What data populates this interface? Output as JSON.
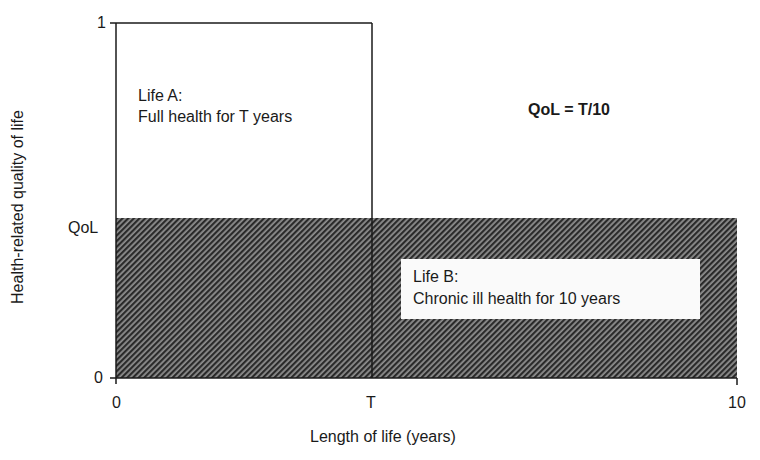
{
  "diagram": {
    "y_axis": {
      "title": "Health-related quality of life",
      "ticks": [
        {
          "label": "1",
          "value": 1
        },
        {
          "label": "QoL",
          "value": "QoL"
        },
        {
          "label": "0",
          "value": 0
        }
      ]
    },
    "x_axis": {
      "title": "Length of life (years)",
      "ticks": [
        {
          "label": "0",
          "value": 0
        },
        {
          "label": "T",
          "value": "T"
        },
        {
          "label": "10",
          "value": 10
        }
      ]
    },
    "life_a": {
      "title": "Life A:",
      "description": "Full health for T years",
      "rect": {
        "x0": 0,
        "x1": "T",
        "y0": 0,
        "y1": 1
      }
    },
    "life_b": {
      "title": "Life B:",
      "description": "Chronic ill health for 10 years",
      "rect": {
        "x0": 0,
        "x1": 10,
        "y0": 0,
        "y1": "QoL"
      },
      "fill": "hatched"
    },
    "formula": "QoL = T/10",
    "colors": {
      "line": "#1a1a1a",
      "hatch_dark": "#2a2a2a",
      "hatch_light": "#9a9a9a",
      "background": "#ffffff"
    }
  }
}
